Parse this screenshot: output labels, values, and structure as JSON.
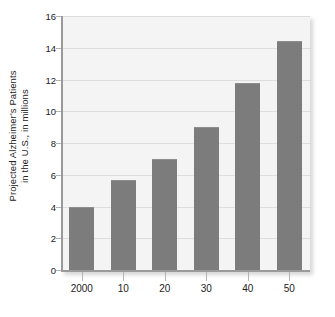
{
  "chart_data": {
    "type": "bar",
    "title": "",
    "subtitle": "",
    "xlabel": "",
    "ylabel_line1": "Projected Alzheimer's Patients",
    "ylabel_line2": "in the U.S., in millions",
    "ylabel": "Projected Alzheimer's Patients in the U.S., in millions",
    "categories": [
      "2000",
      "10",
      "20",
      "30",
      "40",
      "50"
    ],
    "values": [
      4.0,
      5.7,
      7.0,
      9.0,
      11.8,
      14.4
    ],
    "ylim": [
      0,
      16
    ],
    "ytick_values": [
      0,
      2,
      4,
      6,
      8,
      10,
      12,
      14,
      16
    ],
    "ytick_labels": [
      "0",
      "2",
      "4",
      "6",
      "8",
      "10",
      "12",
      "14",
      "16"
    ],
    "grid": "horizontal",
    "legend": "none",
    "colors": {
      "bar_fill": "#7c7c7c",
      "bar_top_edge": "#8d8d8d",
      "plot_background": "#f4f4f4",
      "gridline": "#dddddd",
      "axis_line": "#9a9a9a",
      "tick_mark": "#b4b4b4",
      "text": "#222222",
      "canvas_background": "#ffffff"
    }
  }
}
